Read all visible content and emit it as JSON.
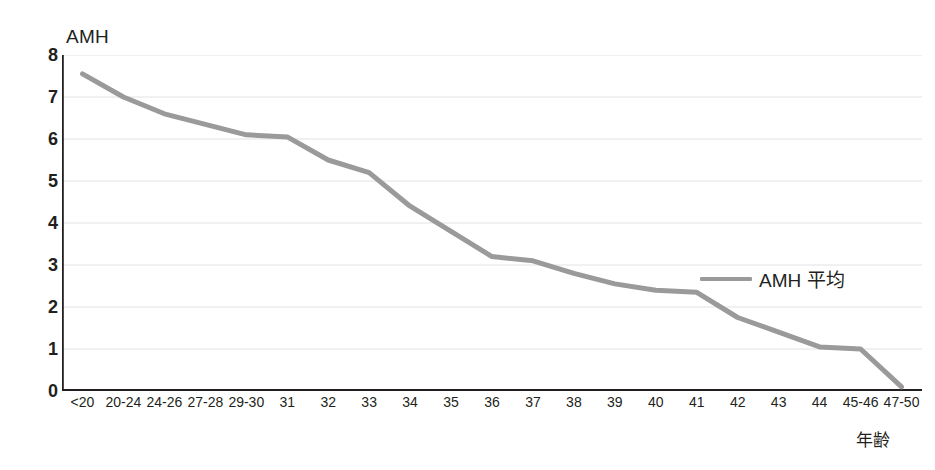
{
  "chart_data": {
    "type": "line",
    "title": "",
    "subtitle": "",
    "xlabel": "年齢",
    "ylabel": "AMH",
    "categories": [
      "<20",
      "20-24",
      "24-26",
      "27-28",
      "29-30",
      "31",
      "32",
      "33",
      "34",
      "35",
      "36",
      "37",
      "38",
      "39",
      "40",
      "41",
      "42",
      "43",
      "44",
      "45-46",
      "47-50"
    ],
    "series": [
      {
        "name": "AMH 平均",
        "color": "#9a9a9a",
        "values": [
          7.55,
          7.0,
          6.6,
          6.35,
          6.1,
          6.05,
          5.5,
          5.2,
          4.4,
          3.8,
          3.2,
          3.1,
          2.8,
          2.55,
          2.4,
          2.35,
          1.75,
          1.4,
          1.05,
          1.0,
          0.1
        ]
      }
    ],
    "ylim": [
      0,
      8
    ],
    "yticks": [
      0,
      1,
      2,
      3,
      4,
      5,
      6,
      7,
      8
    ],
    "ytick_labels": [
      "0",
      "1",
      "2",
      "3",
      "4",
      "5",
      "6",
      "7",
      "8"
    ],
    "grid": "horizontal",
    "grid_color": "#e2e2e2",
    "axis_color": "#231f20",
    "legend": {
      "position": "inside-right",
      "entries": [
        {
          "label": "AMH 平均",
          "color": "#9a9a9a"
        }
      ]
    },
    "background": "#ffffff"
  }
}
